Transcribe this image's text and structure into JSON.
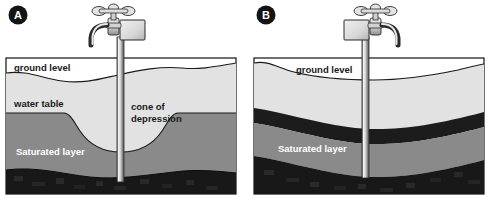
{
  "figure": {
    "background_color": "#ffffff",
    "width": 490,
    "height": 200
  },
  "colors": {
    "unsaturated_layer": "#e2e2e2",
    "saturated_layer": "#8a8a8a",
    "confining_layer": "#1c1c1c",
    "bedrock_layer": "#181818",
    "outline": "#111111",
    "panel_border": "#111111",
    "badge_fill": "#141414",
    "badge_text": "#ffffff",
    "label_text": "#1a1a1a",
    "label_text_light": "#ffffff",
    "pipe_light": "#f2f2f2",
    "pipe_mid": "#b8b8b8",
    "pipe_dark": "#4a4a4a",
    "faucet_fill": "#dcdcdc",
    "faucet_shade": "#9a9a9a"
  },
  "panels": [
    {
      "id": "a",
      "badge_label": "A",
      "faucet_orientation": "spout-left",
      "labels": {
        "ground_level": "ground level",
        "water_table": "water table",
        "cone_of_depression_line1": "cone of",
        "cone_of_depression_line2": "depression",
        "saturated_layer": "Saturated layer"
      }
    },
    {
      "id": "b",
      "badge_label": "B",
      "faucet_orientation": "spout-right",
      "labels": {
        "ground_level": "ground level",
        "saturated_layer": "Saturated layer"
      }
    }
  ]
}
